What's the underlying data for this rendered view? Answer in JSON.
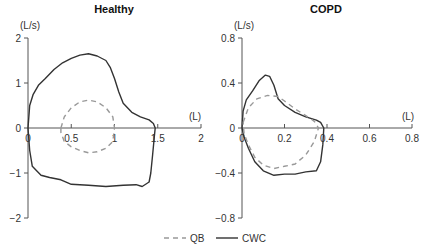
{
  "chart_data": [
    {
      "type": "line",
      "title": "Healthy",
      "xlabel": "(L)",
      "ylabel": "(L/s)",
      "xlim": [
        0,
        2
      ],
      "ylim": [
        -2,
        2
      ],
      "xticks": [
        "0",
        "0.5",
        "1",
        "1.5",
        "2"
      ],
      "yticks": [
        "2",
        "1",
        "0",
        "−1",
        "−2"
      ],
      "grid": false,
      "series": [
        {
          "name": "CWC",
          "style": "solid",
          "points": [
            [
              0,
              0
            ],
            [
              0.02,
              0.5
            ],
            [
              0.06,
              0.75
            ],
            [
              0.12,
              0.95
            ],
            [
              0.2,
              1.1
            ],
            [
              0.3,
              1.3
            ],
            [
              0.4,
              1.45
            ],
            [
              0.5,
              1.55
            ],
            [
              0.6,
              1.62
            ],
            [
              0.7,
              1.65
            ],
            [
              0.8,
              1.6
            ],
            [
              0.9,
              1.5
            ],
            [
              0.95,
              1.35
            ],
            [
              1.0,
              1.1
            ],
            [
              1.05,
              0.8
            ],
            [
              1.1,
              0.55
            ],
            [
              1.2,
              0.35
            ],
            [
              1.3,
              0.25
            ],
            [
              1.4,
              0.18
            ],
            [
              1.45,
              0.1
            ],
            [
              1.47,
              0
            ],
            [
              1.46,
              -0.2
            ],
            [
              1.44,
              -0.6
            ],
            [
              1.42,
              -1.0
            ],
            [
              1.4,
              -1.2
            ],
            [
              1.32,
              -1.3
            ],
            [
              1.25,
              -1.26
            ],
            [
              1.1,
              -1.27
            ],
            [
              0.9,
              -1.3
            ],
            [
              0.7,
              -1.27
            ],
            [
              0.5,
              -1.25
            ],
            [
              0.38,
              -1.15
            ],
            [
              0.25,
              -1.1
            ],
            [
              0.15,
              -1.05
            ],
            [
              0.05,
              -0.85
            ],
            [
              0.02,
              -0.5
            ],
            [
              0,
              0
            ]
          ]
        },
        {
          "name": "QB",
          "style": "dashed",
          "points": [
            [
              0.38,
              0.0
            ],
            [
              0.42,
              0.25
            ],
            [
              0.5,
              0.45
            ],
            [
              0.6,
              0.58
            ],
            [
              0.7,
              0.62
            ],
            [
              0.8,
              0.58
            ],
            [
              0.9,
              0.45
            ],
            [
              0.98,
              0.25
            ],
            [
              1.0,
              0.0
            ],
            [
              0.98,
              -0.3
            ],
            [
              0.9,
              -0.45
            ],
            [
              0.8,
              -0.53
            ],
            [
              0.7,
              -0.55
            ],
            [
              0.6,
              -0.5
            ],
            [
              0.5,
              -0.42
            ],
            [
              0.42,
              -0.3
            ],
            [
              0.38,
              -0.1
            ],
            [
              0.38,
              0.0
            ]
          ]
        }
      ]
    },
    {
      "type": "line",
      "title": "COPD",
      "xlabel": "(L)",
      "ylabel": "(L/s)",
      "xlim": [
        0,
        0.8
      ],
      "ylim": [
        -0.8,
        0.8
      ],
      "xticks": [
        "0",
        "0.2",
        "0.4",
        "0.6",
        "0.8"
      ],
      "yticks": [
        "0.8",
        "0.4",
        "0",
        "−0.4",
        "−0.8"
      ],
      "grid": false,
      "series": [
        {
          "name": "CWC",
          "style": "solid",
          "points": [
            [
              0,
              0
            ],
            [
              0.005,
              0.15
            ],
            [
              0.02,
              0.25
            ],
            [
              0.05,
              0.33
            ],
            [
              0.08,
              0.42
            ],
            [
              0.11,
              0.47
            ],
            [
              0.13,
              0.46
            ],
            [
              0.15,
              0.38
            ],
            [
              0.17,
              0.26
            ],
            [
              0.2,
              0.2
            ],
            [
              0.25,
              0.14
            ],
            [
              0.3,
              0.1
            ],
            [
              0.35,
              0.07
            ],
            [
              0.37,
              0.05
            ],
            [
              0.385,
              0.0
            ],
            [
              0.38,
              -0.15
            ],
            [
              0.37,
              -0.3
            ],
            [
              0.35,
              -0.38
            ],
            [
              0.3,
              -0.39
            ],
            [
              0.25,
              -0.41
            ],
            [
              0.2,
              -0.41
            ],
            [
              0.15,
              -0.42
            ],
            [
              0.1,
              -0.38
            ],
            [
              0.06,
              -0.3
            ],
            [
              0.03,
              -0.18
            ],
            [
              0.01,
              -0.08
            ],
            [
              0,
              0
            ]
          ]
        },
        {
          "name": "QB",
          "style": "dashed",
          "points": [
            [
              0.005,
              0.05
            ],
            [
              0.03,
              0.18
            ],
            [
              0.07,
              0.26
            ],
            [
              0.12,
              0.29
            ],
            [
              0.17,
              0.28
            ],
            [
              0.2,
              0.24
            ],
            [
              0.25,
              0.17
            ],
            [
              0.3,
              0.11
            ],
            [
              0.34,
              0.06
            ],
            [
              0.36,
              0.0
            ],
            [
              0.34,
              -0.12
            ],
            [
              0.3,
              -0.24
            ],
            [
              0.25,
              -0.32
            ],
            [
              0.2,
              -0.34
            ],
            [
              0.15,
              -0.36
            ],
            [
              0.1,
              -0.33
            ],
            [
              0.06,
              -0.26
            ],
            [
              0.03,
              -0.15
            ],
            [
              0.01,
              -0.05
            ],
            [
              0.005,
              0.05
            ]
          ]
        }
      ]
    }
  ],
  "panels": [
    {
      "title": "Healthy",
      "ylabel": "(L/s)",
      "xlabel": "(L)"
    },
    {
      "title": "COPD",
      "ylabel": "(L/s)",
      "xlabel": "(L)"
    }
  ],
  "legend": {
    "items": [
      {
        "label": "QB",
        "style": "dashed"
      },
      {
        "label": "CWC",
        "style": "solid"
      }
    ]
  }
}
